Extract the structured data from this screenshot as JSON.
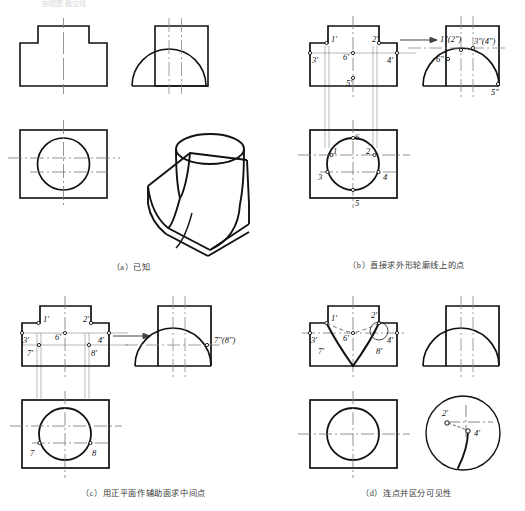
{
  "figure": {
    "top_partial_text": "剖视图 截交线",
    "panels": [
      {
        "id": "a",
        "caption": "（a）已知",
        "views": [
          "front-view",
          "side-view",
          "top-view",
          "isometric-view"
        ],
        "labels": []
      },
      {
        "id": "b",
        "caption": "（b）直接求外形轮廓线上的点",
        "views": [
          "front-view",
          "side-view",
          "top-view"
        ],
        "front_labels": [
          "1'",
          "2'",
          "3'",
          "4'",
          "5'",
          "6'"
        ],
        "side_labels": [
          "1\"(2\")",
          "3\"(4\")",
          "6\"",
          "5\""
        ],
        "top_labels": [
          "1",
          "2",
          "3",
          "4",
          "5",
          "6"
        ],
        "arrow": "projection-arrow"
      },
      {
        "id": "c",
        "caption": "（c）用正平面作辅助面求中间点",
        "views": [
          "front-view",
          "side-view",
          "top-view"
        ],
        "front_labels": [
          "1'",
          "2'",
          "3'",
          "4'",
          "6'",
          "7'",
          "8'"
        ],
        "side_labels": [
          "7\"(8\")"
        ],
        "top_labels": [
          "7",
          "8"
        ],
        "arrow": "projection-arrow"
      },
      {
        "id": "d",
        "caption": "（d）连点并区分可见性",
        "views": [
          "front-view",
          "side-view",
          "top-view",
          "detail-view"
        ],
        "front_labels": [
          "1'",
          "2'",
          "3'",
          "4'",
          "6'",
          "7'",
          "8'"
        ],
        "detail_labels": [
          "2'",
          "4'"
        ],
        "top_labels": []
      }
    ],
    "colors": {
      "outline": "#111111",
      "thin_line": "#555555",
      "center_line": "#777777",
      "projection_line": "#888888",
      "caption": "#3a3a3a"
    }
  }
}
